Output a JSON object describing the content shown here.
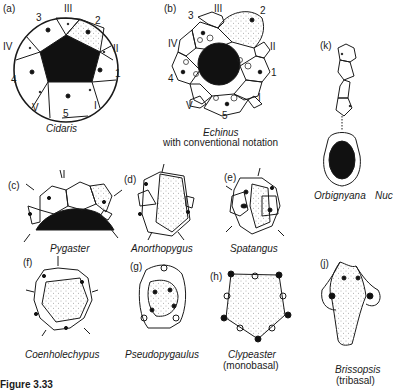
{
  "figure": {
    "panels": [
      {
        "id": "a",
        "label": "(a)",
        "genus": "Cidaris",
        "ambulacra": [
          "I",
          "II",
          "III",
          "IV",
          "V"
        ],
        "interambulacra": [
          "1",
          "2",
          "3",
          "4",
          "5"
        ]
      },
      {
        "id": "b",
        "label": "(b)",
        "genus": "Echinus",
        "note": "with conventional notation",
        "ambulacra": [
          "I",
          "II",
          "III",
          "IV",
          "V"
        ],
        "interambulacra": [
          "1",
          "2",
          "3",
          "4",
          "5"
        ]
      },
      {
        "id": "k",
        "label": "(k)",
        "genus": "Orbignyana",
        "genus2": "Nuc"
      },
      {
        "id": "c",
        "label": "(c)",
        "genus": "Pygaster"
      },
      {
        "id": "d",
        "label": "(d)",
        "genus": "Anorthopygus"
      },
      {
        "id": "e",
        "label": "(e)",
        "genus": "Spatangus"
      },
      {
        "id": "f",
        "label": "(f)",
        "genus": "Coenholechypus"
      },
      {
        "id": "g",
        "label": "(g)",
        "genus": "Pseudopygaulus"
      },
      {
        "id": "h",
        "label": "(h)",
        "genus": "Clypeaster",
        "note": "(monobasal)"
      },
      {
        "id": "j",
        "label": "(j)",
        "genus": "Brissopsis",
        "note": "(tribasal)"
      }
    ],
    "caption_fragment": "Figure 3.33"
  },
  "colors": {
    "ink": "#1a1a1a",
    "stipple": "#8a8a8a",
    "paper": "#ffffff"
  }
}
